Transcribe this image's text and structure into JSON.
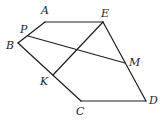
{
  "diagram": {
    "points": {
      "A": {
        "label": "A",
        "x": 45,
        "y": 22,
        "lx": 41,
        "ly": 14
      },
      "E": {
        "label": "E",
        "x": 103,
        "y": 22,
        "lx": 101,
        "ly": 17
      },
      "P": {
        "label": "P",
        "x": 28,
        "y": 36,
        "lx": 20,
        "ly": 33
      },
      "B": {
        "label": "B",
        "x": 18,
        "y": 43,
        "lx": 6,
        "ly": 49
      },
      "M": {
        "label": "M",
        "x": 125,
        "y": 63,
        "lx": 129,
        "ly": 66
      },
      "K": {
        "label": "K",
        "x": 53,
        "y": 75,
        "lx": 40,
        "ly": 85
      },
      "C": {
        "label": "C",
        "x": 81,
        "y": 101,
        "lx": 76,
        "ly": 115
      },
      "D": {
        "label": "D",
        "x": 146,
        "y": 101,
        "lx": 149,
        "ly": 104
      }
    },
    "segments": [
      {
        "name": "segment-AE",
        "from": "A",
        "to": "E"
      },
      {
        "name": "segment-AB",
        "from": "A",
        "to": "B"
      },
      {
        "name": "segment-BC",
        "from": "B",
        "to": "C"
      },
      {
        "name": "segment-CD",
        "from": "C",
        "to": "D"
      },
      {
        "name": "segment-ED",
        "from": "E",
        "to": "D"
      },
      {
        "name": "segment-PM",
        "from": "P",
        "to": "M"
      },
      {
        "name": "segment-KE",
        "from": "K",
        "to": "E"
      }
    ]
  }
}
